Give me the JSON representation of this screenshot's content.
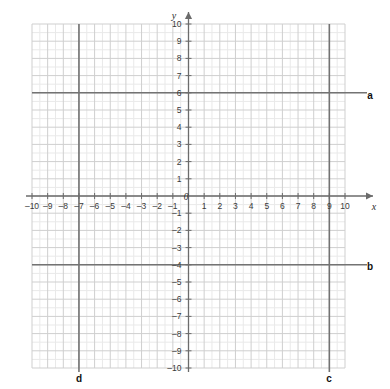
{
  "chart_data": {
    "type": "line",
    "title": "",
    "xlabel": "x",
    "ylabel": "y",
    "xlim": [
      -10,
      10
    ],
    "ylim": [
      -10,
      10
    ],
    "grid": true,
    "minor_grid_step": 0.5,
    "major_grid_step": 1,
    "legend_position": "inline-right",
    "x_ticks": [
      -10,
      -9,
      -8,
      -7,
      -6,
      -5,
      -4,
      -3,
      -2,
      -1,
      1,
      2,
      3,
      4,
      5,
      6,
      7,
      8,
      9,
      10
    ],
    "y_ticks": [
      -10,
      -9,
      -8,
      -7,
      -6,
      -5,
      -4,
      -3,
      -2,
      -1,
      1,
      2,
      3,
      4,
      5,
      6,
      7,
      8,
      9,
      10
    ],
    "x_tick_labels": [
      "–10",
      "–9",
      "–8",
      "–7",
      "–6",
      "–5",
      "–4",
      "–3",
      "–2",
      "–1",
      "1",
      "2",
      "3",
      "4",
      "5",
      "6",
      "7",
      "8",
      "9",
      "10"
    ],
    "y_tick_labels": [
      "–10",
      "–9",
      "–8",
      "–7",
      "–6",
      "–5",
      "–4",
      "–3",
      "–2",
      "–1",
      "1",
      "2",
      "3",
      "4",
      "5",
      "6",
      "7",
      "8",
      "9",
      "10"
    ],
    "origin_label": "0",
    "series": [
      {
        "name": "a",
        "orientation": "horizontal",
        "equation": "y = 6",
        "value": 6
      },
      {
        "name": "b",
        "orientation": "horizontal",
        "equation": "y = -4",
        "value": -4
      },
      {
        "name": "c",
        "orientation": "vertical",
        "equation": "x = 9",
        "value": 9
      },
      {
        "name": "d",
        "orientation": "vertical",
        "equation": "x = -7",
        "value": -7
      }
    ]
  },
  "axes": {
    "x_axis_name": "x",
    "y_axis_name": "y",
    "origin": "0"
  },
  "labels": {
    "line_a": "a",
    "line_b": "b",
    "line_c": "c",
    "line_d": "d"
  },
  "x_ticks": [
    {
      "label": "–10"
    },
    {
      "label": "–9"
    },
    {
      "label": "–8"
    },
    {
      "label": "–7"
    },
    {
      "label": "–6"
    },
    {
      "label": "–5"
    },
    {
      "label": "–4"
    },
    {
      "label": "–3"
    },
    {
      "label": "–2"
    },
    {
      "label": "–1"
    },
    {
      "label": "1"
    },
    {
      "label": "2"
    },
    {
      "label": "3"
    },
    {
      "label": "4"
    },
    {
      "label": "5"
    },
    {
      "label": "6"
    },
    {
      "label": "7"
    },
    {
      "label": "8"
    },
    {
      "label": "9"
    },
    {
      "label": "10"
    }
  ],
  "y_ticks": [
    {
      "label": "10"
    },
    {
      "label": "9"
    },
    {
      "label": "8"
    },
    {
      "label": "7"
    },
    {
      "label": "6"
    },
    {
      "label": "5"
    },
    {
      "label": "4"
    },
    {
      "label": "3"
    },
    {
      "label": "2"
    },
    {
      "label": "1"
    },
    {
      "label": "–1"
    },
    {
      "label": "–2"
    },
    {
      "label": "–3"
    },
    {
      "label": "–4"
    },
    {
      "label": "–5"
    },
    {
      "label": "–6"
    },
    {
      "label": "–7"
    },
    {
      "label": "–8"
    },
    {
      "label": "–9"
    },
    {
      "label": "–10"
    }
  ],
  "colors": {
    "minor_grid": "#e9e9e9",
    "major_grid": "#cfcfcf",
    "axis": "#6b6b6b",
    "plot_line": "#737373",
    "text": "#3a3a3a"
  }
}
